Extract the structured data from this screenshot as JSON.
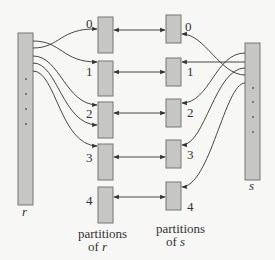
{
  "diagram": {
    "relations": {
      "r": {
        "label": "r"
      },
      "s": {
        "label": "s"
      }
    },
    "partitions_r": {
      "caption_line1": "partitions",
      "caption_line2_prefix": "of ",
      "caption_line2_var": "r",
      "indices": [
        "0",
        "1",
        "2",
        "3",
        "4"
      ]
    },
    "partitions_s": {
      "caption_line1": "partitions",
      "caption_line2_prefix": "of ",
      "caption_line2_var": "s",
      "indices": [
        "0",
        "1",
        "2",
        "3",
        "4"
      ]
    },
    "colors": {
      "box_fill": "#c6c6c4",
      "box_stroke": "#777777",
      "line": "#333333",
      "background": "#f7f7f5"
    }
  }
}
